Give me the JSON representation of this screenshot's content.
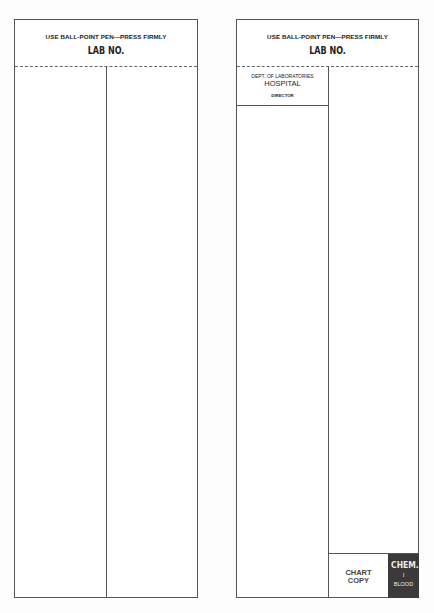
{
  "left_form": {
    "instruction": "USE BALL-POINT PEN—PRESS FIRMLY",
    "lab_no_label": "LAB NO."
  },
  "right_form": {
    "instruction": "USE BALL-POINT PEN—PRESS FIRMLY",
    "lab_no_label": "LAB NO.",
    "dept_label": "DEPT. OF LABORATORIES",
    "hospital_label": "HOSPITAL",
    "director_label": "DIRECTOR",
    "chart_copy_line1": "CHART",
    "chart_copy_line2": "COPY",
    "category_line1": "CHEM.",
    "category_line2": "I",
    "category_line3": "BLOOD",
    "category_bg_color": "#3a3a3a"
  }
}
